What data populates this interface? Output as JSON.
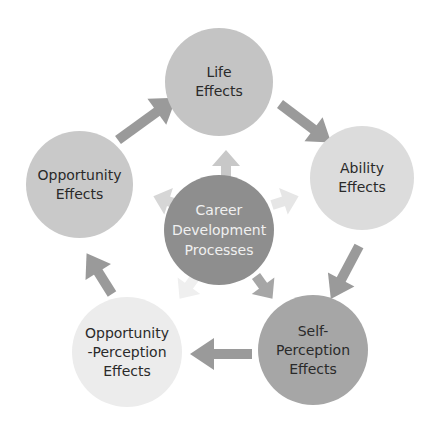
{
  "diagram": {
    "title": "",
    "center": {
      "label": "Career\nDevelopment\nProcesses",
      "color": "#8e8e8e"
    },
    "nodes": [
      {
        "id": "life",
        "label": "Life\nEffects",
        "color": "#c4c4c4"
      },
      {
        "id": "ability",
        "label": "Ability\nEffects",
        "color": "#dcdcdc"
      },
      {
        "id": "self-perception",
        "label": "Self-\nPerception\nEffects",
        "color": "#a6a6a6"
      },
      {
        "id": "opportunity-perception",
        "label": "Opportunity\n-Perception\nEffects",
        "color": "#ececec"
      },
      {
        "id": "opportunity",
        "label": "Opportunity\nEffects",
        "color": "#c9c9c9"
      }
    ],
    "cycle_arrows": [
      {
        "from": "opportunity",
        "to": "life"
      },
      {
        "from": "life",
        "to": "ability"
      },
      {
        "from": "ability",
        "to": "self-perception"
      },
      {
        "from": "self-perception",
        "to": "opportunity-perception"
      },
      {
        "from": "opportunity-perception",
        "to": "opportunity"
      }
    ],
    "radial_arrows": [
      {
        "from": "center",
        "to": "life"
      },
      {
        "from": "center",
        "to": "ability"
      },
      {
        "from": "center",
        "to": "self-perception"
      },
      {
        "from": "center",
        "to": "opportunity-perception"
      },
      {
        "from": "center",
        "to": "opportunity"
      }
    ],
    "colors": {
      "cycle_arrow": "#9a9a9a",
      "radial_life": "#c8c8c8",
      "radial_ability": "#e6e6e6",
      "radial_self": "#a6a6a6",
      "radial_opp_perc": "#efefef",
      "radial_opp": "#d6d6d6"
    }
  }
}
